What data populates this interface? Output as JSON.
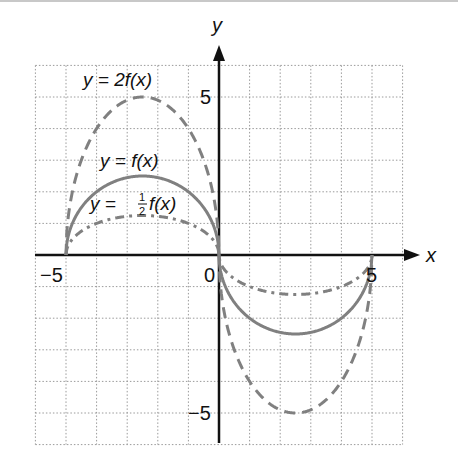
{
  "chart_data": {
    "type": "line",
    "title": "",
    "xlabel": "x",
    "ylabel": "y",
    "xlim": [
      -6,
      6
    ],
    "ylim": [
      -6,
      6
    ],
    "grid": true,
    "grid_style": "dotted",
    "x_tick_labels": [
      {
        "value": -5,
        "label": "−5"
      },
      {
        "value": 0,
        "label": "0"
      },
      {
        "value": 5,
        "label": "5"
      }
    ],
    "y_tick_labels": [
      {
        "value": 5,
        "label": "5"
      },
      {
        "value": -5,
        "label": "−5"
      }
    ],
    "series": [
      {
        "name": "y = 2f(x)",
        "label_parts": {
          "lhs": "y",
          "eq": "=",
          "rhs": "2f(x)"
        },
        "scale": 2,
        "style": "dashed",
        "color": "#808080",
        "key_points": [
          [
            -5,
            0
          ],
          [
            -2.5,
            5
          ],
          [
            0,
            0
          ],
          [
            2.5,
            -5
          ],
          [
            5,
            0
          ]
        ]
      },
      {
        "name": "y = f(x)",
        "label_parts": {
          "lhs": "y",
          "eq": "=",
          "rhs": "f(x)"
        },
        "scale": 1,
        "style": "solid",
        "color": "#808080",
        "key_points": [
          [
            -5,
            0
          ],
          [
            -2.5,
            2.5
          ],
          [
            0,
            0
          ],
          [
            2.5,
            -2.5
          ],
          [
            5,
            0
          ]
        ]
      },
      {
        "name": "y = ½f(x)",
        "label_parts": {
          "lhs": "y",
          "eq": "=",
          "num": "1",
          "den": "2",
          "rhs": "f(x)"
        },
        "scale": 0.5,
        "style": "dash-dot",
        "color": "#808080",
        "key_points": [
          [
            -5,
            0
          ],
          [
            -2.5,
            1.25
          ],
          [
            0,
            0
          ],
          [
            2.5,
            -1.25
          ],
          [
            5,
            0
          ]
        ]
      }
    ],
    "colors": {
      "axis": "#111111",
      "grid": "#9a9a9a",
      "curve": "#808080",
      "topbar": "#c8c8c8"
    }
  },
  "labels": {
    "x_axis": "x",
    "y_axis": "y",
    "tick_neg5_x": "−5",
    "tick_0": "0",
    "tick_5_x": "5",
    "tick_5_y": "5",
    "tick_neg5_y": "−5",
    "curve_2f": "y = 2f(x)",
    "curve_f": "y = f(x)",
    "curve_half_lhs": "y = ",
    "curve_half_num": "1",
    "curve_half_den": "2",
    "curve_half_rhs": "f(x)"
  }
}
